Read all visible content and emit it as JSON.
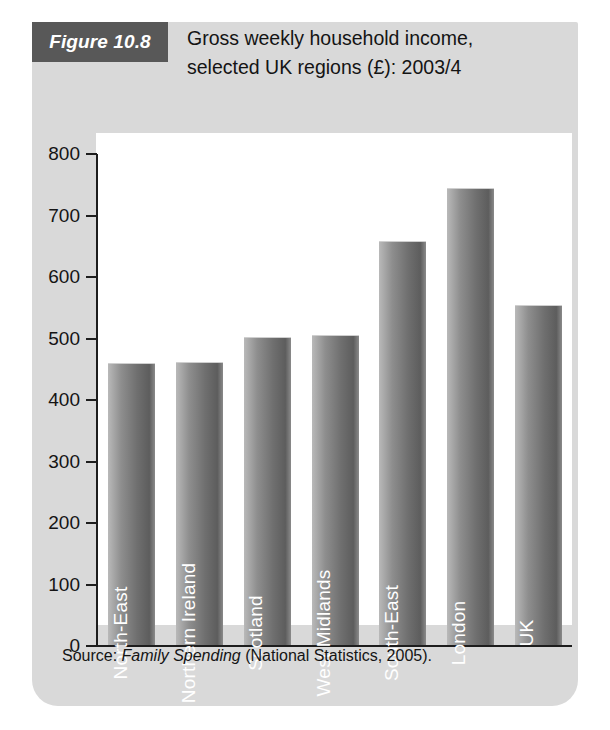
{
  "figure": {
    "badge_label": "Figure 10.8",
    "title_line_1": "Gross weekly household income,",
    "title_line_2": "selected UK regions (£): 2003/4",
    "source_prefix": "Source: ",
    "source_italic": "Family Spending",
    "source_suffix": " (National Statistics, 2005).",
    "badge_bg_color": "#585858",
    "panel_bg_color": "#d9d9d9",
    "plot_bg_color": "#ffffff",
    "bar_color": "#6f6f6f",
    "axis_color": "#1d1d1d",
    "bar_label_color": "#ffffff"
  },
  "chart_data": {
    "type": "bar",
    "title": "Gross weekly household income, selected UK regions (£): 2003/4",
    "xlabel": "",
    "ylabel": "",
    "ylim": [
      0,
      800
    ],
    "ytick_labels": [
      "800",
      "700",
      "600",
      "500",
      "400",
      "300",
      "200",
      "100",
      "0"
    ],
    "yticks": [
      800,
      700,
      600,
      500,
      400,
      300,
      200,
      100,
      0
    ],
    "grid": false,
    "legend": false,
    "categories": [
      "North-East",
      "Northern Ireland",
      "Scotland",
      "West Midlands",
      "South-East",
      "London",
      "UK"
    ],
    "values": [
      457,
      459,
      500,
      503,
      655,
      741,
      552
    ],
    "units": "£ per week",
    "source": "Source: Family Spending (National Statistics, 2005)."
  }
}
